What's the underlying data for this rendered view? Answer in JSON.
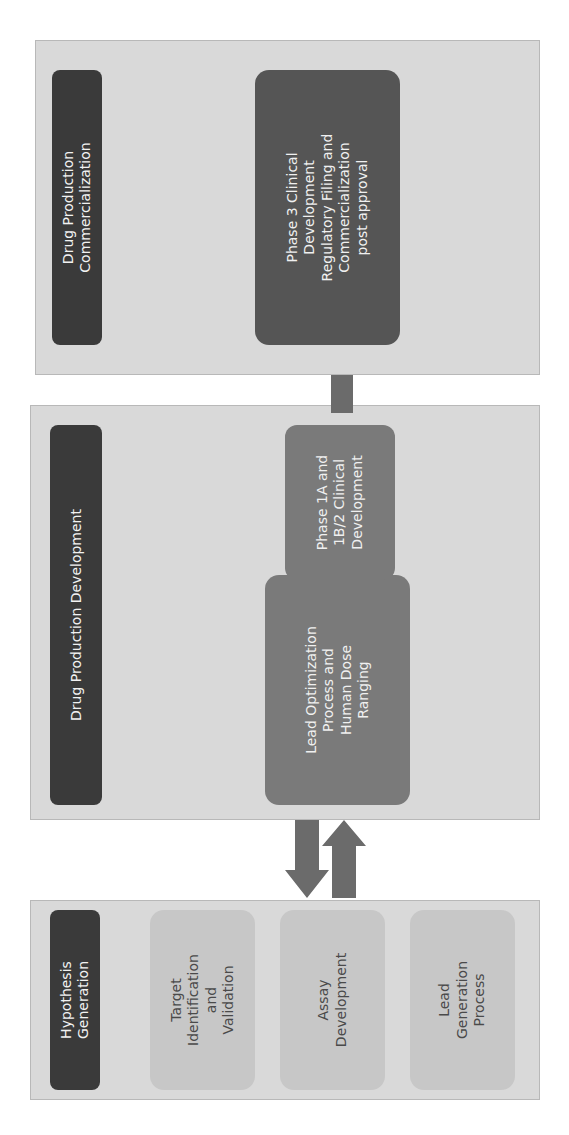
{
  "diagram": {
    "orientation": "rotated-90-ccw",
    "stages": [
      {
        "id": "hypothesis",
        "header": "Hypothesis\nGeneration",
        "steps": [
          "Target\nIdentification\nand\nValidation",
          "Assay\nDevelopment",
          "Lead\nGeneration\nProcess"
        ]
      },
      {
        "id": "development",
        "header": "Drug Production Development",
        "steps": [
          "Lead Optimization\nProcess and\nHuman Dose\nRanging",
          "Phase 1A and\n1B/2 Clinical\nDevelopment"
        ]
      },
      {
        "id": "commercialization",
        "header": "Drug Production\nCommercialization",
        "steps": [
          "Phase 3 Clinical\nDevelopment\nRegulatory Filing and\nCommercialization\npost approval"
        ]
      }
    ],
    "connections": [
      {
        "from": "Lead Optimization Process and Human Dose Ranging",
        "to": "Assay Development",
        "direction": "back"
      },
      {
        "from": "Assay Development",
        "to": "Lead Optimization Process and Human Dose Ranging",
        "direction": "forward"
      },
      {
        "from": "Phase 1A and 1B/2 Clinical Development",
        "to": "Phase 3 Clinical Development Regulatory Filing and Commercialization post approval",
        "direction": "forward"
      }
    ],
    "colors": {
      "panel": "#d9d9d9",
      "header": "#3a3a3a",
      "light_box": "#c7c7c7",
      "mid_box": "#7a7a7a",
      "dark_box": "#555555",
      "arrow": "#6b6b6b"
    }
  }
}
